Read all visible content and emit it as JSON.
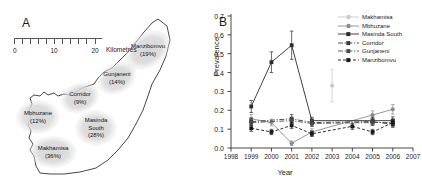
{
  "figure": {
    "panel_a": {
      "label": "A",
      "scalebar": {
        "ticks": [
          "0",
          "10",
          "20"
        ],
        "unit": "Kilometres"
      },
      "regions": [
        {
          "name": "Manzibomvu",
          "prevalence_label": "(19%)",
          "pct": 19,
          "cx": 148,
          "cy": 50,
          "rx": 25,
          "ry": 17,
          "rot": -35
        },
        {
          "name": "Gunjaneni",
          "prevalence_label": "(14%)",
          "pct": 14,
          "cx": 117,
          "cy": 78,
          "rx": 21,
          "ry": 15,
          "rot": -30
        },
        {
          "name": "Corridor",
          "prevalence_label": "(9%)",
          "pct": 9,
          "cx": 80,
          "cy": 98,
          "rx": 20,
          "ry": 15,
          "rot": -20
        },
        {
          "name": "Mbhuzane",
          "prevalence_label": "(12%)",
          "pct": 12,
          "cx": 38,
          "cy": 117,
          "rx": 22,
          "ry": 17,
          "rot": 0
        },
        {
          "name": "Masinda\nSouth",
          "prevalence_label": "(28%)",
          "pct": 28,
          "cx": 96,
          "cy": 128,
          "rx": 21,
          "ry": 18,
          "rot": 0
        },
        {
          "name": "Makhamisa",
          "prevalence_label": "(36%)",
          "pct": 36,
          "cx": 53,
          "cy": 152,
          "rx": 24,
          "ry": 16,
          "rot": 0
        }
      ]
    },
    "panel_b": {
      "label": "B"
    }
  },
  "chart_data": {
    "type": "line",
    "title": "",
    "xlabel": "Year",
    "ylabel": "Prevalence",
    "xlim": [
      1998,
      2007
    ],
    "ylim": [
      0.0,
      0.7
    ],
    "grid": false,
    "legend_position": "top-right",
    "xticks": [
      "1998",
      "1999",
      "2000",
      "2001",
      "2002",
      "2003",
      "2004",
      "2005",
      "2006",
      "2007"
    ],
    "yticks": [
      "0.0",
      "0.1",
      "0.2",
      "0.3",
      "0.4",
      "0.5",
      "0.6",
      "0.7"
    ],
    "series": [
      {
        "name": "Makhamisa",
        "color": "#c9c9c9",
        "dash": "none",
        "marker": "circle",
        "x": [
          2003
        ],
        "values": [
          0.33
        ],
        "err": [
          0.085
        ]
      },
      {
        "name": "Mbhuzane",
        "color": "#8c8c8c",
        "dash": "none",
        "marker": "circle",
        "x": [
          1999,
          2000,
          2001,
          2002,
          2005,
          2006
        ],
        "values": [
          0.155,
          0.135,
          0.025,
          0.085,
          0.175,
          0.205
        ],
        "err": [
          0.022,
          0.018,
          0.012,
          0.017,
          0.022,
          0.025
        ]
      },
      {
        "name": "Masinda South",
        "color": "#2b2b2b",
        "dash": "none",
        "marker": "square",
        "x": [
          1999,
          2000,
          2001,
          2002,
          2005,
          2006
        ],
        "values": [
          0.22,
          0.455,
          0.545,
          0.145,
          0.145,
          0.145
        ],
        "err": [
          0.032,
          0.055,
          0.075,
          0.018,
          0.018,
          0.02
        ]
      },
      {
        "name": "Corridor",
        "color": "#3a3a3a",
        "dash": "dashdot",
        "marker": "square",
        "x": [
          1999,
          2001,
          2002,
          2005,
          2006
        ],
        "values": [
          0.14,
          0.155,
          0.135,
          0.14,
          0.125
        ],
        "err": [
          0.018,
          0.022,
          0.018,
          0.018,
          0.016
        ]
      },
      {
        "name": "Gunjaneni",
        "color": "#4a4a4a",
        "dash": "dashdot",
        "marker": "square",
        "x": [
          1999,
          2001,
          2002,
          2005,
          2006
        ],
        "values": [
          0.135,
          0.145,
          0.13,
          0.135,
          0.135
        ],
        "err": [
          0.016,
          0.018,
          0.016,
          0.016,
          0.016
        ]
      },
      {
        "name": "Manzibomvu",
        "color": "#1a1a1a",
        "dash": "dashed",
        "marker": "square",
        "x": [
          1999,
          2000,
          2001,
          2002,
          2004,
          2005,
          2006
        ],
        "values": [
          0.105,
          0.085,
          0.12,
          0.075,
          0.115,
          0.085,
          0.135
        ],
        "err": [
          0.016,
          0.014,
          0.016,
          0.014,
          0.016,
          0.014,
          0.018
        ]
      }
    ]
  }
}
